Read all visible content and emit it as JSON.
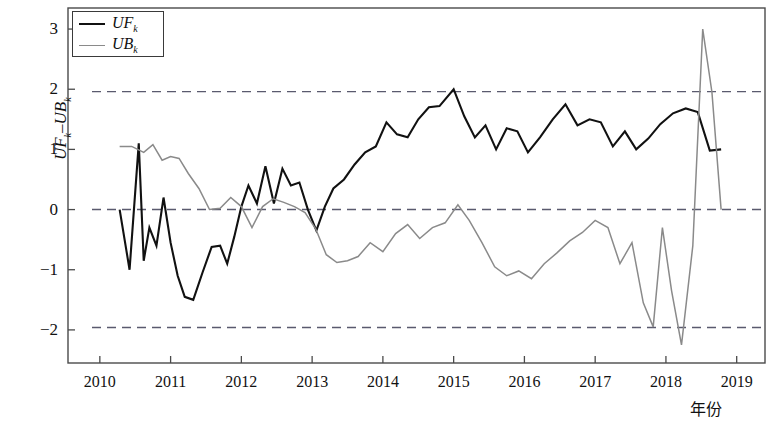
{
  "chart_data": {
    "type": "line",
    "title": "",
    "xlabel": "年份",
    "ylabel": "UF_k－UB_k",
    "ylabel_parts": {
      "uf": "UF",
      "sub_k1": "k",
      "dash": "–",
      "ub": "UB",
      "sub_k2": "k"
    },
    "xlim": [
      2009.55,
      2019.4
    ],
    "ylim": [
      -2.55,
      3.35
    ],
    "xticks": [
      2010,
      2011,
      2012,
      2013,
      2014,
      2015,
      2016,
      2017,
      2018,
      2019
    ],
    "xtick_labels": [
      "2010",
      "2011",
      "2012",
      "2013",
      "2014",
      "2015",
      "2016",
      "2017",
      "2018",
      "2019"
    ],
    "yticks": [
      -2,
      -1,
      0,
      1,
      2,
      3
    ],
    "ytick_labels": [
      "−2",
      "−1",
      "0",
      "1",
      "2",
      "3"
    ],
    "grid": false,
    "legend_position": "top-left",
    "legend": [
      {
        "name": "UF_k",
        "label_main": "UF",
        "label_sub": "k",
        "color": "#111111",
        "width": 2.1
      },
      {
        "name": "UB_k",
        "label_main": "UB",
        "label_sub": "k",
        "color": "#8a8a8a",
        "width": 1.6
      }
    ],
    "reference_lines": [
      {
        "value": 1.96,
        "style": "dashed",
        "color": "#5a5a6e",
        "label": ""
      },
      {
        "value": 0.0,
        "style": "dashed",
        "color": "#5a5a6e",
        "label": ""
      },
      {
        "value": -1.96,
        "style": "dashed",
        "color": "#5a5a6e",
        "label": ""
      }
    ],
    "series": [
      {
        "name": "UF_k",
        "color": "#111111",
        "x": [
          2010.28,
          2010.42,
          2010.55,
          2010.62,
          2010.7,
          2010.8,
          2010.9,
          2011.0,
          2011.1,
          2011.2,
          2011.32,
          2011.45,
          2011.58,
          2011.7,
          2011.8,
          2011.9,
          2012.0,
          2012.1,
          2012.22,
          2012.34,
          2012.46,
          2012.58,
          2012.7,
          2012.82,
          2012.94,
          2013.06,
          2013.18,
          2013.3,
          2013.45,
          2013.6,
          2013.75,
          2013.9,
          2014.05,
          2014.2,
          2014.35,
          2014.5,
          2014.65,
          2014.8,
          2015.0,
          2015.15,
          2015.3,
          2015.45,
          2015.6,
          2015.75,
          2015.9,
          2016.05,
          2016.22,
          2016.4,
          2016.58,
          2016.75,
          2016.92,
          2017.08,
          2017.25,
          2017.42,
          2017.58,
          2017.75,
          2017.92,
          2018.1,
          2018.28,
          2018.45,
          2018.62,
          2018.78
        ],
        "y": [
          0.0,
          -1.0,
          1.1,
          -0.85,
          -0.3,
          -0.6,
          0.2,
          -0.55,
          -1.1,
          -1.45,
          -1.5,
          -1.05,
          -0.62,
          -0.6,
          -0.9,
          -0.45,
          0.05,
          0.4,
          0.1,
          0.72,
          0.1,
          0.68,
          0.4,
          0.45,
          0.0,
          -0.35,
          0.05,
          0.35,
          0.5,
          0.75,
          0.95,
          1.05,
          1.45,
          1.25,
          1.2,
          1.5,
          1.7,
          1.72,
          2.0,
          1.55,
          1.2,
          1.4,
          1.0,
          1.35,
          1.3,
          0.95,
          1.2,
          1.5,
          1.75,
          1.4,
          1.5,
          1.45,
          1.05,
          1.3,
          1.0,
          1.18,
          1.42,
          1.6,
          1.68,
          1.62,
          0.98,
          1.0
        ]
      },
      {
        "name": "UB_k",
        "color": "#8a8a8a",
        "x": [
          2010.28,
          2010.45,
          2010.62,
          2010.75,
          2010.88,
          2011.0,
          2011.12,
          2011.25,
          2011.4,
          2011.55,
          2011.7,
          2011.85,
          2012.0,
          2012.15,
          2012.3,
          2012.45,
          2012.6,
          2012.75,
          2012.9,
          2013.05,
          2013.2,
          2013.35,
          2013.5,
          2013.65,
          2013.82,
          2014.0,
          2014.18,
          2014.35,
          2014.52,
          2014.7,
          2014.88,
          2015.06,
          2015.22,
          2015.4,
          2015.58,
          2015.75,
          2015.92,
          2016.1,
          2016.28,
          2016.46,
          2016.64,
          2016.82,
          2017.0,
          2017.18,
          2017.35,
          2017.52,
          2017.68,
          2017.82,
          2017.95,
          2018.08,
          2018.22,
          2018.38,
          2018.52,
          2018.65,
          2018.78
        ],
        "y": [
          1.05,
          1.05,
          0.95,
          1.08,
          0.82,
          0.88,
          0.85,
          0.6,
          0.35,
          0.0,
          0.02,
          0.2,
          0.05,
          -0.3,
          0.05,
          0.18,
          0.12,
          0.05,
          -0.05,
          -0.32,
          -0.75,
          -0.88,
          -0.85,
          -0.78,
          -0.55,
          -0.7,
          -0.4,
          -0.25,
          -0.48,
          -0.3,
          -0.22,
          0.08,
          -0.18,
          -0.55,
          -0.95,
          -1.1,
          -1.02,
          -1.15,
          -0.9,
          -0.72,
          -0.52,
          -0.38,
          -0.18,
          -0.3,
          -0.9,
          -0.55,
          -1.55,
          -1.95,
          -0.3,
          -1.35,
          -2.25,
          -0.6,
          3.0,
          1.95,
          0.0
        ]
      }
    ]
  },
  "axes": {
    "frame_color": "#4a4a4a"
  }
}
